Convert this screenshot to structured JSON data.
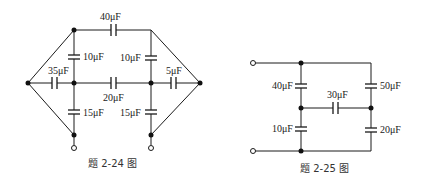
{
  "figures": [
    {
      "id": "fig-2-24",
      "caption": "题 2-24 图",
      "capacitors": {
        "top": "40μF",
        "upper_left_vertical": "10μF",
        "upper_right_vertical": "10μF",
        "left_horizontal": "35μF",
        "middle_horizontal": "20μF",
        "right_horizontal": "5μF",
        "lower_left_vertical": "15μF",
        "lower_right_vertical": "15μF"
      }
    },
    {
      "id": "fig-2-25",
      "caption": "题 2-25 图",
      "capacitors": {
        "upper_left": "40μF",
        "lower_left": "10μF",
        "middle_horizontal": "30μF",
        "upper_right": "50μF",
        "lower_right": "20μF"
      }
    }
  ],
  "colors": {
    "line": "#1a1a1a",
    "background": "#ffffff"
  }
}
